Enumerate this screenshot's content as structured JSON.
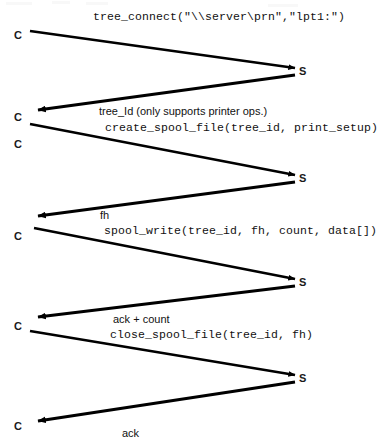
{
  "diagram": {
    "type": "sequence-diagram",
    "background_color": "#ffffff",
    "line_color": "#000000",
    "actors": {
      "client_label": "C",
      "server_label": "S"
    },
    "client_marks": [
      {
        "label": "C",
        "x": 14,
        "y": 30
      },
      {
        "label": "C",
        "x": 14,
        "y": 112
      },
      {
        "label": "C",
        "x": 14,
        "y": 139
      },
      {
        "label": "C",
        "x": 14,
        "y": 231
      },
      {
        "label": "C",
        "x": 14,
        "y": 321
      },
      {
        "label": "C",
        "x": 14,
        "y": 421
      }
    ],
    "server_marks": [
      {
        "label": "S",
        "x": 299,
        "y": 66
      },
      {
        "label": "S",
        "x": 299,
        "y": 173
      },
      {
        "label": "S",
        "x": 299,
        "y": 277
      },
      {
        "label": "S",
        "x": 299,
        "y": 373
      }
    ],
    "messages": [
      {
        "id": "tree-connect-request",
        "direction": "client-to-server",
        "text": "tree_connect(\"\\\\server\\prn\",\"lpt1:\")",
        "font": "mono",
        "label_x": 93,
        "label_y": 10,
        "from": {
          "x": 30,
          "y": 31
        },
        "to": {
          "x": 295,
          "y": 68
        }
      },
      {
        "id": "tree-connect-response",
        "direction": "server-to-client",
        "text": "tree_Id (only supports printer ops.)",
        "font": "sans",
        "label_x": 99,
        "label_y": 105,
        "from": {
          "x": 295,
          "y": 75
        },
        "to": {
          "x": 38,
          "y": 110
        }
      },
      {
        "id": "create-spool-file-request",
        "direction": "client-to-server",
        "text": "create_spool_file(tree_id, print_setup)",
        "font": "mono",
        "label_x": 105,
        "label_y": 121,
        "from": {
          "x": 30,
          "y": 124
        },
        "to": {
          "x": 295,
          "y": 175
        }
      },
      {
        "id": "create-spool-file-response",
        "direction": "server-to-client",
        "text": "fh",
        "font": "sans",
        "label_x": 100,
        "label_y": 209,
        "from": {
          "x": 295,
          "y": 182
        },
        "to": {
          "x": 38,
          "y": 216
        }
      },
      {
        "id": "spool-write-request",
        "direction": "client-to-server",
        "text": "spool_write(tree_id, fh, count, data[])",
        "font": "mono",
        "label_x": 104,
        "label_y": 224,
        "from": {
          "x": 34,
          "y": 228
        },
        "to": {
          "x": 295,
          "y": 279
        }
      },
      {
        "id": "spool-write-response",
        "direction": "server-to-client",
        "text": "ack + count",
        "font": "sans",
        "label_x": 113,
        "label_y": 313,
        "from": {
          "x": 295,
          "y": 286
        },
        "to": {
          "x": 38,
          "y": 317
        }
      },
      {
        "id": "close-spool-file-request",
        "direction": "client-to-server",
        "text": "close_spool_file(tree_id, fh)",
        "font": "mono",
        "label_x": 110,
        "label_y": 328,
        "from": {
          "x": 30,
          "y": 331
        },
        "to": {
          "x": 295,
          "y": 375
        }
      },
      {
        "id": "close-spool-file-response",
        "direction": "server-to-client",
        "text": "ack",
        "font": "sans",
        "label_x": 122,
        "label_y": 427,
        "from": {
          "x": 295,
          "y": 382
        },
        "to": {
          "x": 38,
          "y": 421
        }
      }
    ]
  }
}
